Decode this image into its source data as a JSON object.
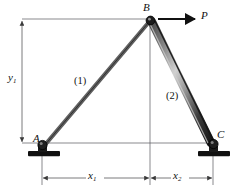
{
  "figure": {
    "type": "engineering-free-body-diagram",
    "background_color": "#ffffff",
    "line_color": "#3a3a3a",
    "member_color": "#1a1a1a"
  },
  "joints": [
    {
      "id": "A",
      "label": "A",
      "x": 42,
      "y": 145,
      "support": "pin"
    },
    {
      "id": "B",
      "label": "B",
      "x": 150,
      "y": 20,
      "support": "free"
    },
    {
      "id": "C",
      "label": "C",
      "x": 213,
      "y": 143,
      "support": "pin"
    }
  ],
  "members": [
    {
      "id": "1",
      "label": "(1)",
      "from": "A",
      "to": "B",
      "style": "thin-bar"
    },
    {
      "id": "2",
      "label": "(2)",
      "from": "B",
      "to": "C",
      "style": "thick-shaded-bar"
    }
  ],
  "load": {
    "name": "P",
    "label": "P",
    "applied_at": "B",
    "direction": "horizontal-right",
    "arrow_from_x": 158,
    "arrow_to_x": 197,
    "arrow_y": 19
  },
  "dimensions": [
    {
      "name": "y1",
      "label": "y",
      "subscript": "1",
      "orientation": "vertical",
      "from_y": 20,
      "to_y": 143,
      "axis_x": 22
    },
    {
      "name": "x1",
      "label": "x",
      "subscript": "1",
      "orientation": "horizontal",
      "from_x": 42,
      "to_x": 150,
      "axis_y": 178
    },
    {
      "name": "x2",
      "label": "x",
      "subscript": "2",
      "orientation": "horizontal",
      "from_x": 150,
      "to_x": 213,
      "axis_y": 178
    }
  ],
  "extension_lines": [
    {
      "name": "top-horizontal-from-y1-to-B",
      "x1": 22,
      "y1": 19,
      "x2": 152,
      "y2": 19
    },
    {
      "name": "bottom-horizontal-A-to-C",
      "x1": 22,
      "y1": 143,
      "x2": 213,
      "y2": 143
    },
    {
      "name": "vertical-from-B-to-x-dimension",
      "x1": 150,
      "y1": 22,
      "x2": 150,
      "y2": 184
    },
    {
      "name": "vertical-from-A-support",
      "x1": 42,
      "y1": 155,
      "x2": 42,
      "y2": 184
    },
    {
      "name": "vertical-from-C-support",
      "x1": 213,
      "y1": 155,
      "x2": 213,
      "y2": 184
    }
  ]
}
